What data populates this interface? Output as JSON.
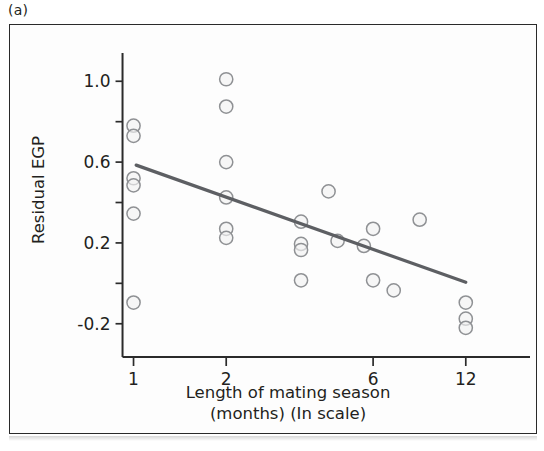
{
  "panel": {
    "label": "(a)"
  },
  "chart_data": {
    "type": "scatter",
    "title": "",
    "xlabel_line1": "Length of mating season",
    "xlabel_line2": "(months) (In scale)",
    "ylabel": "Residual EGP",
    "x_scale": "log",
    "x_ticks": [
      1,
      2,
      6,
      12
    ],
    "x_tick_labels": [
      "1",
      "2",
      "6",
      "12"
    ],
    "y_ticks": [
      -0.2,
      0.0,
      0.2,
      0.4,
      0.6,
      0.8,
      1.0
    ],
    "y_tick_labels": [
      "-0.2",
      "",
      "0.2",
      "",
      "0.6",
      "",
      "1.0"
    ],
    "xlim": [
      0.82,
      15.5
    ],
    "ylim": [
      -0.32,
      1.13
    ],
    "grid": false,
    "legend": false,
    "points": [
      {
        "x": 1.0,
        "y": 0.78
      },
      {
        "x": 1.0,
        "y": 0.73
      },
      {
        "x": 1.0,
        "y": 0.52
      },
      {
        "x": 1.0,
        "y": 0.485
      },
      {
        "x": 1.0,
        "y": 0.345
      },
      {
        "x": 1.0,
        "y": -0.095
      },
      {
        "x": 2.0,
        "y": 1.01
      },
      {
        "x": 2.0,
        "y": 0.875
      },
      {
        "x": 2.0,
        "y": 0.6
      },
      {
        "x": 2.0,
        "y": 0.425
      },
      {
        "x": 2.0,
        "y": 0.27
      },
      {
        "x": 2.0,
        "y": 0.225
      },
      {
        "x": 3.5,
        "y": 0.305
      },
      {
        "x": 3.5,
        "y": 0.195
      },
      {
        "x": 3.5,
        "y": 0.165
      },
      {
        "x": 3.5,
        "y": 0.015
      },
      {
        "x": 4.3,
        "y": 0.455
      },
      {
        "x": 4.6,
        "y": 0.21
      },
      {
        "x": 5.6,
        "y": 0.185
      },
      {
        "x": 6.0,
        "y": 0.27
      },
      {
        "x": 6.0,
        "y": 0.015
      },
      {
        "x": 7.0,
        "y": -0.035
      },
      {
        "x": 8.5,
        "y": 0.315
      },
      {
        "x": 12.0,
        "y": -0.095
      },
      {
        "x": 12.0,
        "y": -0.175
      },
      {
        "x": 12.0,
        "y": -0.22
      }
    ],
    "regression_line": {
      "x_start": 1.02,
      "y_start": 0.585,
      "x_end": 12.0,
      "y_end": 0.005
    }
  }
}
